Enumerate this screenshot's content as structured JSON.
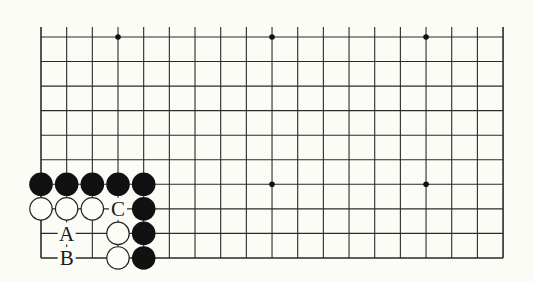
{
  "diagram": {
    "type": "go-board-fragment",
    "grid": {
      "columns": 19,
      "rows": 10,
      "x0": 41,
      "dx": 25.67,
      "y0": 37,
      "dy": 24.55,
      "open_top": true,
      "line_color": "#2a2a2a",
      "background": "#fcfcf7"
    },
    "star_points": [
      [
        3,
        0
      ],
      [
        9,
        0
      ],
      [
        15,
        0
      ],
      [
        9,
        6
      ],
      [
        15,
        6
      ]
    ],
    "stones": {
      "black": [
        [
          0,
          6
        ],
        [
          1,
          6
        ],
        [
          2,
          6
        ],
        [
          3,
          6
        ],
        [
          4,
          6
        ],
        [
          4,
          7
        ],
        [
          4,
          8
        ],
        [
          4,
          9
        ]
      ],
      "white": [
        [
          0,
          7
        ],
        [
          1,
          7
        ],
        [
          2,
          7
        ],
        [
          3,
          8
        ],
        [
          3,
          9
        ]
      ]
    },
    "labels": [
      {
        "text": "C",
        "col": 3,
        "row": 7
      },
      {
        "text": "A",
        "col": 1,
        "row": 8
      },
      {
        "text": "B",
        "col": 1,
        "row": 9
      }
    ]
  }
}
